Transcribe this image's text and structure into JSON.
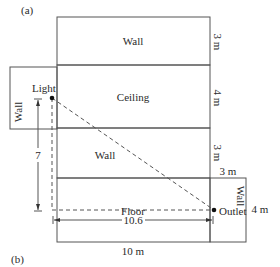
{
  "labels": {
    "part_a": "(a)",
    "part_b": "(b)",
    "top_wall": "Wall",
    "ceiling": "Ceiling",
    "middle_wall": "Wall",
    "floor": "Floor",
    "left_wall": "Wall",
    "right_wall": "Wall",
    "light": "Light",
    "outlet": "Outlet"
  },
  "dimensions": {
    "top_wall_height": "3 m",
    "ceiling_depth": "4 m",
    "middle_wall_height": "3 m",
    "right_wall_width": "3 m",
    "floor_depth": "4 m",
    "room_length": "10 m",
    "vertical_run": "7",
    "horizontal_run": "10.6"
  },
  "colors": {
    "line": "#555555",
    "text": "#2a2a2a"
  }
}
